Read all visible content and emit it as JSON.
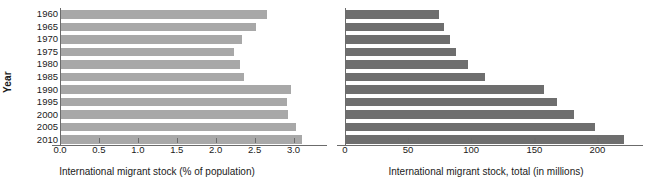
{
  "figure": {
    "background_color": "#ffffff",
    "panel_count": 2
  },
  "axis_titles": {
    "y": "Year",
    "x_left": "International migrant stock (% of population)",
    "x_right": "International migrant stock, total (in millions)"
  },
  "colors": {
    "bar_left": "#a8a8a8",
    "bar_right": "#6e6e6e",
    "axis": "#6b6b6b",
    "text": "#1a1a1a"
  },
  "chart_data": [
    {
      "type": "bar",
      "orientation": "horizontal",
      "title": "",
      "xlabel": "International migrant stock (% of population)",
      "ylabel": "Year",
      "categories": [
        "1960",
        "1965",
        "1970",
        "1975",
        "1980",
        "1985",
        "1990",
        "1995",
        "2000",
        "2005",
        "2010"
      ],
      "values": [
        2.65,
        2.5,
        2.33,
        2.22,
        2.3,
        2.35,
        2.95,
        2.9,
        2.92,
        3.02,
        3.1
      ],
      "xlim": [
        0.0,
        3.25
      ],
      "ylim": [
        0,
        11
      ],
      "xticks": [
        0.0,
        0.5,
        1.0,
        1.5,
        2.0,
        2.5,
        3.0
      ],
      "xticklabels": [
        "0.0",
        "0.5",
        "1.0",
        "1.5",
        "2.0",
        "2.5",
        "3.0"
      ],
      "bar_color": "#a8a8a8",
      "grid": false,
      "legend": false
    },
    {
      "type": "bar",
      "orientation": "horizontal",
      "title": "",
      "xlabel": "International migrant stock, total (in millions)",
      "ylabel": "",
      "categories": [
        "1960",
        "1965",
        "1970",
        "1975",
        "1980",
        "1985",
        "1990",
        "1995",
        "2000",
        "2005",
        "2010"
      ],
      "values": [
        74,
        78,
        82,
        87,
        97,
        110,
        157,
        167,
        181,
        197,
        220
      ],
      "xlim": [
        0,
        225
      ],
      "ylim": [
        0,
        11
      ],
      "xticks": [
        0,
        50,
        100,
        150,
        200
      ],
      "xticklabels": [
        "0",
        "50",
        "100",
        "150",
        "200"
      ],
      "bar_color": "#6e6e6e",
      "grid": false,
      "legend": false
    }
  ]
}
